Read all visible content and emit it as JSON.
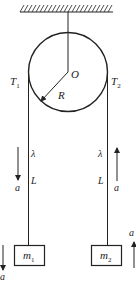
{
  "diagram": {
    "type": "pulley-system",
    "labels": {
      "center": "O",
      "radius": "R",
      "tension_left": "T",
      "tension_left_sub": "1",
      "tension_right": "T",
      "tension_right_sub": "2",
      "lambda_left": "λ",
      "lambda_right": "λ",
      "length_left": "L",
      "length_right": "L",
      "accel_left_rope": "a",
      "accel_right_rope": "a",
      "accel_mass_left": "a",
      "accel_mass_right": "a",
      "mass_left": "m",
      "mass_left_sub": "1",
      "mass_right": "m",
      "mass_right_sub": "2"
    },
    "arrows": {
      "left_rope": "down",
      "right_rope": "up",
      "mass_left": "down",
      "mass_right": "up"
    },
    "colors": {
      "line": "#222222",
      "background": "#ffffff"
    }
  }
}
